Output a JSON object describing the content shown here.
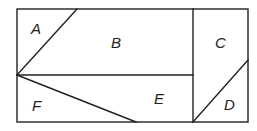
{
  "diagram": {
    "type": "partitioned-rectangle",
    "stroke_color": "#222222",
    "background": "#ffffff",
    "outer_rect": {
      "x": 17,
      "y": 9,
      "width": 231,
      "height": 113
    },
    "regions": [
      {
        "id": "A",
        "label": "A",
        "label_pos": [
          37,
          34
        ]
      },
      {
        "id": "B",
        "label": "B",
        "label_pos": [
          116,
          48
        ]
      },
      {
        "id": "C",
        "label": "C",
        "label_pos": [
          220,
          48
        ]
      },
      {
        "id": "D",
        "label": "D",
        "label_pos": [
          229,
          110
        ]
      },
      {
        "id": "E",
        "label": "E",
        "label_pos": [
          159,
          104
        ]
      },
      {
        "id": "F",
        "label": "F",
        "label_pos": [
          37,
          111
        ]
      }
    ]
  }
}
